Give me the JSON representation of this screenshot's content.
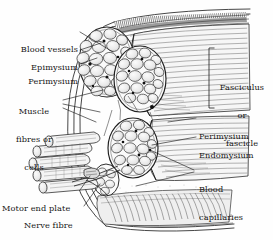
{
  "figure": {
    "kind": "anatomical-line-drawing",
    "background_color": "#fefefe",
    "ink_color": "#1a1a1a"
  },
  "labels": {
    "blood_vessels": "Blood vessels",
    "epimysium": "Epimysium",
    "perimysium_left": "Perimysium",
    "muscle_fibres_line1": "Muscle",
    "muscle_fibres_line2": "fibres or",
    "muscle_fibres_line3": "cells",
    "motor_end_plate": "Motor end plate",
    "nerve_fibre": "Nerve fibre",
    "fasciculus_line1": "Fasciculus",
    "fasciculus_line2": "or",
    "fasciculus_line3": "fascicle",
    "perimysium_right": "Perimysium",
    "endomysium": "Endomysium",
    "blood_capillaries_line1": "Blood",
    "blood_capillaries_line2": "capillaries"
  }
}
